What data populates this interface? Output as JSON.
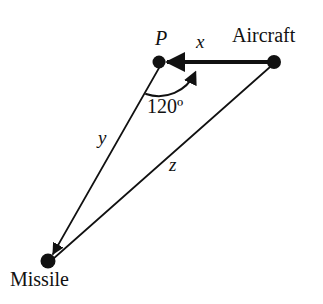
{
  "figure": {
    "type": "geometry-diagram",
    "background_color": "#ffffff",
    "stroke_color": "#111111"
  },
  "vertices": {
    "p": {
      "label": "P",
      "x": 159,
      "y": 62,
      "radius": 6
    },
    "aircraft": {
      "label": "Aircraft",
      "x": 274,
      "y": 62,
      "radius": 7
    },
    "missile": {
      "label": "Missile",
      "x": 48,
      "y": 261,
      "radius": 7
    }
  },
  "sides": {
    "x": {
      "label": "x",
      "from": "p",
      "to": "aircraft",
      "arrow_direction": "toward-p",
      "stroke_width": 4
    },
    "y": {
      "label": "y",
      "from": "p",
      "to": "missile",
      "arrow_direction": "toward-missile",
      "stroke_width": 1.6
    },
    "z": {
      "label": "z",
      "from": "aircraft",
      "to": "missile",
      "arrow_direction": "none",
      "stroke_width": 1.6
    }
  },
  "angle": {
    "label": "120º",
    "value": 120,
    "unit": "degrees",
    "at_vertex": "P",
    "between_sides": [
      "y",
      "x"
    ],
    "arc_arrow": "toward-x"
  }
}
